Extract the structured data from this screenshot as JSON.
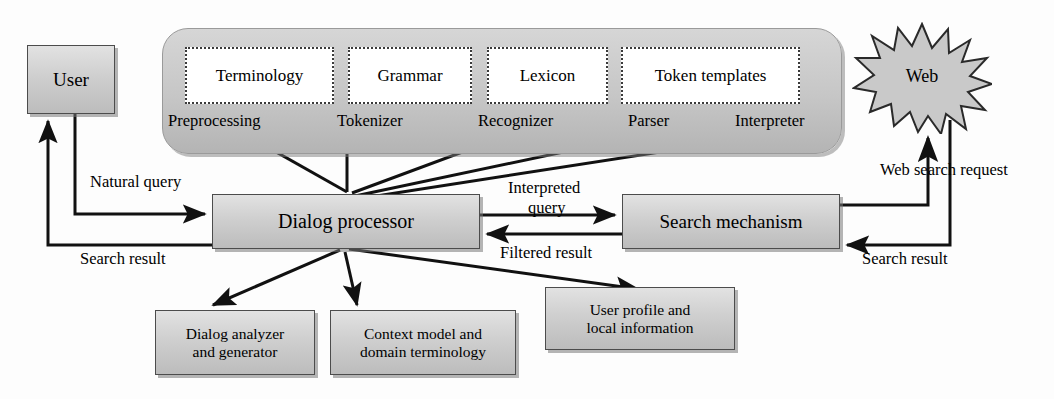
{
  "diagram": {
    "colors": {
      "box_fill": "#cfcfcf",
      "box_border": "#4c4c4c",
      "pipeline_fill": "#c6c6c6",
      "line": "#111111",
      "page_bg": "#ffffff"
    }
  },
  "nodes": {
    "user": "User",
    "dialog_processor": "Dialog processor",
    "search_mechanism": "Search mechanism",
    "web": "Web",
    "dialog_analyzer": "Dialog analyzer\nand generator",
    "context_model": "Context model and\ndomain terminology",
    "user_profile": "User profile and\nlocal information"
  },
  "pipeline": {
    "resources": [
      "Terminology",
      "Grammar",
      "Lexicon",
      "Token templates"
    ],
    "stages": [
      "Preprocessing",
      "Tokenizer",
      "Recognizer",
      "Parser",
      "Interpreter"
    ]
  },
  "flows": {
    "natural_query": "Natural query",
    "search_result_left": "Search result",
    "interpreted": "Interpreted",
    "query": "query",
    "filtered_result": "Filtered result",
    "web_search_request": "Web search request",
    "search_result_right": "Search result"
  }
}
